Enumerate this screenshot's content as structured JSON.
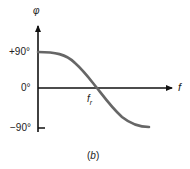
{
  "chart_data": {
    "type": "line",
    "title": "",
    "caption": "(b)",
    "xlabel": "f",
    "ylabel": "φ",
    "x_annotation": {
      "label": "f",
      "subscript": "r",
      "meaning": "resonant frequency, zero crossing"
    },
    "yticks": [
      "+90°",
      "0°",
      "−90°"
    ],
    "ylim": [
      -90,
      90
    ],
    "grid": false,
    "series": [
      {
        "name": "phase",
        "description": "Phase decreases from +90° at low f, crosses 0° at f_r, approaches −90° at high f",
        "x_relative": [
          0,
          0.1,
          0.25,
          0.45,
          0.55,
          0.75,
          0.9,
          1.0
        ],
        "values": [
          90,
          88,
          70,
          15,
          -15,
          -65,
          -82,
          -85
        ]
      }
    ],
    "colors": {
      "curve": "#666666",
      "axes": "#111111"
    }
  },
  "labels": {
    "phi": "φ",
    "tick_pos90": "+90°",
    "tick_zero": "0°",
    "tick_neg90": "−90°",
    "x_axis": "f",
    "fr_main": "f",
    "fr_sub": "r",
    "caption": "(b)"
  }
}
